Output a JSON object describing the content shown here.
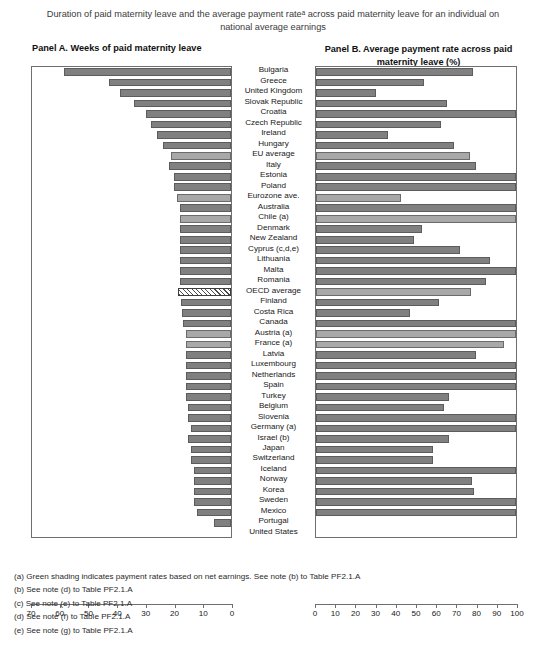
{
  "title": "Duration of paid maternity leave and the average payment rateᵃ across paid maternity leave for an individual on national average earnings",
  "panel_a_heading": "Panel A. Weeks of paid maternity leave",
  "panel_b_heading": "Panel B. Average payment rate across paid maternity leave (%)",
  "footnotes": [
    "(a) Green shading indicates payment rates based on net earnings. See note (b) to Table PF2.1.A",
    "(b) See note (d) to Table PF2.1.A",
    "(c) See note (e) to Table PF2.1.A",
    "(d) See note (f) to Table PF2.1.A",
    "(e) See note (g) to Table PF2.1.A"
  ],
  "colors": {
    "bar_dark": "#808080",
    "bar_light": "#a8a8a8",
    "bar_hatched_outline": "#3d3d3d",
    "frame": "#6f6f6f",
    "text": "#181818"
  },
  "chart_data": {
    "type": "bar",
    "orientation": "horizontal",
    "panels": [
      {
        "id": "panel-a",
        "label": "Panel A. Weeks of paid maternity leave",
        "xlabel": "",
        "ylabel": "",
        "xlim": [
          70,
          0
        ],
        "reversed_axis": true,
        "ticks": [
          70,
          60,
          50,
          40,
          30,
          20,
          10,
          0
        ],
        "grid": false,
        "unit": "weeks"
      },
      {
        "id": "panel-b",
        "label": "Panel B. Average payment rate across paid maternity leave (%)",
        "xlabel": "",
        "ylabel": "",
        "xlim": [
          0,
          100
        ],
        "reversed_axis": false,
        "ticks": [
          0,
          10,
          20,
          30,
          40,
          50,
          60,
          70,
          80,
          90,
          100
        ],
        "grid": false,
        "unit": "percent"
      }
    ],
    "categories": [
      "Bulgaria",
      "Greece",
      "United Kingdom",
      "Slovak Republic",
      "Croatia",
      "Czech Republic",
      "Ireland",
      "Hungary",
      "EU average",
      "Italy",
      "Estonia",
      "Poland",
      "Eurozone ave.",
      "Australia",
      "Chile (a)",
      "Denmark",
      "New Zealand",
      "Cyprus (c,d,e)",
      "Lithuania",
      "Malta",
      "Romania",
      "OECD average",
      "Finland",
      "Costa Rica",
      "Canada",
      "Austria (a)",
      "France (a)",
      "Latvia",
      "Luxembourg",
      "Netherlands",
      "Spain",
      "Turkey",
      "Belgium",
      "Slovenia",
      "Germany (a)",
      "Israel (b)",
      "Japan",
      "Switzerland",
      "Iceland",
      "Norway",
      "Korea",
      "Sweden",
      "Mexico",
      "Portugal",
      "United States"
    ],
    "series": [
      {
        "name": "Weeks of paid maternity leave",
        "panel": "panel-a",
        "values": [
          58.6,
          43.0,
          39.0,
          34.0,
          30.0,
          28.0,
          26.0,
          24.0,
          21.1,
          21.7,
          20.0,
          20.0,
          19.0,
          18.0,
          18.0,
          18.0,
          18.0,
          18.0,
          18.0,
          18.0,
          18.0,
          18.5,
          17.5,
          17.3,
          17.0,
          16.0,
          16.0,
          16.0,
          16.0,
          16.0,
          16.0,
          16.0,
          15.0,
          15.0,
          14.0,
          15.0,
          14.0,
          14.0,
          13.0,
          13.0,
          12.9,
          12.9,
          12.0,
          6.0,
          0.0
        ],
        "shading": [
          "dark",
          "dark",
          "dark",
          "dark",
          "dark",
          "dark",
          "dark",
          "dark",
          "light",
          "dark",
          "dark",
          "dark",
          "light",
          "dark",
          "light",
          "dark",
          "dark",
          "dark",
          "dark",
          "dark",
          "dark",
          "hatched",
          "dark",
          "dark",
          "dark",
          "light",
          "light",
          "dark",
          "dark",
          "dark",
          "dark",
          "dark",
          "dark",
          "dark",
          "dark",
          "dark",
          "dark",
          "dark",
          "dark",
          "dark",
          "dark",
          "dark",
          "dark",
          "dark",
          "dark"
        ]
      },
      {
        "name": "Average payment rate (%)",
        "panel": "panel-b",
        "values": [
          78.4,
          53.8,
          30.2,
          65.5,
          100.0,
          62.6,
          36.0,
          68.8,
          77.0,
          80.0,
          100.0,
          100.0,
          42.4,
          100.0,
          100.0,
          53.0,
          49.0,
          72.0,
          87.2,
          100.0,
          85.0,
          77.4,
          61.4,
          47.0,
          100.0,
          100.0,
          94.1,
          80.2,
          100.0,
          100.0,
          100.0,
          66.7,
          64.1,
          100.0,
          100.0,
          66.7,
          58.4,
          58.6,
          100.0,
          78.0,
          79.0,
          100.0,
          100.0,
          0.0,
          0.0
        ],
        "shading": [
          "dark",
          "dark",
          "dark",
          "dark",
          "dark",
          "dark",
          "dark",
          "dark",
          "light",
          "dark",
          "dark",
          "dark",
          "light",
          "dark",
          "light",
          "dark",
          "dark",
          "dark",
          "dark",
          "dark",
          "dark",
          "light",
          "dark",
          "dark",
          "dark",
          "light",
          "light",
          "dark",
          "dark",
          "dark",
          "dark",
          "dark",
          "dark",
          "dark",
          "dark",
          "dark",
          "dark",
          "dark",
          "dark",
          "dark",
          "dark",
          "dark",
          "dark",
          "dark",
          "dark"
        ]
      }
    ]
  }
}
